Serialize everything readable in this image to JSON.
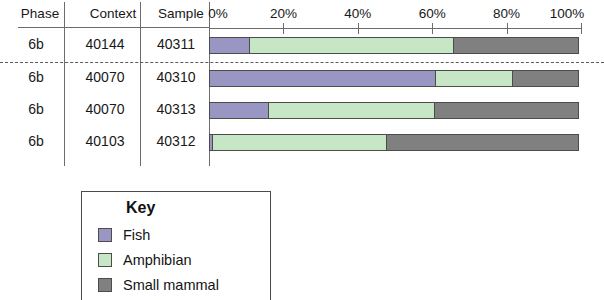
{
  "table": {
    "headers": {
      "phase": "Phase",
      "context": "Context",
      "sample": "Sample"
    },
    "rows": [
      {
        "phase": "6b",
        "context": "40144",
        "sample": "40311"
      },
      {
        "phase": "6b",
        "context": "40070",
        "sample": "40310"
      },
      {
        "phase": "6b",
        "context": "40070",
        "sample": "40313"
      },
      {
        "phase": "6b",
        "context": "40103",
        "sample": "40312"
      }
    ]
  },
  "axis": {
    "ticks": [
      "0%",
      "20%",
      "40%",
      "60%",
      "80%",
      "100%"
    ],
    "min": 0,
    "max": 100
  },
  "legend": {
    "title": "Key",
    "items": [
      {
        "label": "Fish",
        "color": "#9a96c4"
      },
      {
        "label": "Amphibian",
        "color": "#c6e6c6"
      },
      {
        "label": "Small mammal",
        "color": "#808080"
      }
    ]
  },
  "chart_data": {
    "type": "bar",
    "orientation": "horizontal",
    "stacked": true,
    "normalized": true,
    "title": "",
    "xlabel": "",
    "ylabel": "",
    "xlim": [
      0,
      100
    ],
    "xticks": [
      0,
      20,
      40,
      60,
      80,
      100
    ],
    "xticklabels": [
      "0%",
      "20%",
      "40%",
      "60%",
      "80%",
      "100%"
    ],
    "grid": false,
    "legend_position": "below-left",
    "categories": [
      "40311",
      "40310",
      "40313",
      "40312"
    ],
    "series": [
      {
        "name": "Fish",
        "color": "#9a96c4",
        "values": [
          11,
          61,
          16,
          1
        ]
      },
      {
        "name": "Amphibian",
        "color": "#c6e6c6",
        "values": [
          55,
          21,
          45,
          47
        ]
      },
      {
        "name": "Small mammal",
        "color": "#808080",
        "values": [
          34,
          18,
          39,
          52
        ]
      }
    ]
  }
}
